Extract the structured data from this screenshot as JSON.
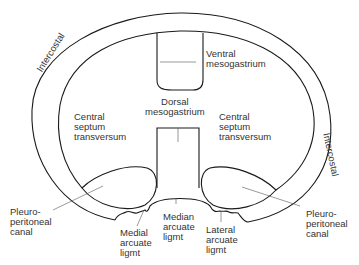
{
  "diagram": {
    "labels": {
      "ventral_mesogastrium": "Ventral\nmesogastrium",
      "dorsal_mesogastrium": "Dorsal\nmesogastrium",
      "central_septum_left": "Central\nseptum\ntransversum",
      "central_septum_right": "Central\nseptum\ntransversum",
      "intercostal_left": "Intercostal",
      "intercostal_right": "Intercostal",
      "pleuroperitoneal_left": "Pleuro-\nperitoneal\ncanal",
      "pleuroperitoneal_right": "Pleuro-\nperitoneal\ncanal",
      "medial_arcuate": "Medial\narcuate\nligmt",
      "median_arcuate": "Median\narcuate\nligmt",
      "lateral_arcuate": "Lateral\narcuate\nligmt"
    },
    "colors": {
      "line": "#1a1a1a",
      "text": "#333333"
    }
  }
}
